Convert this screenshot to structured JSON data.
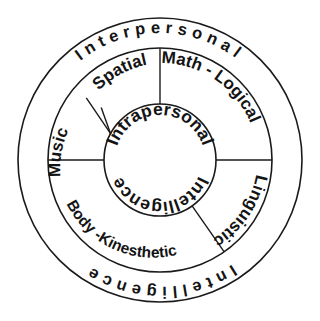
{
  "diagram": {
    "type": "concentric-circle-diagram",
    "background_color": "#ffffff",
    "line_color": "#1a1a1a",
    "text_color": "#141414",
    "geometry": {
      "center_x": 160,
      "center_y": 160,
      "outer_radius": 142,
      "middle_radius": 112,
      "inner_radius": 56
    },
    "outer_ring": {
      "name": "outer-ring",
      "top_label": "Interpersonal",
      "bottom_label": "Intelligence"
    },
    "inner_core": {
      "name": "inner-core",
      "line_one": "Intrapersonal",
      "line_two": "Intelligence"
    },
    "segments": [
      {
        "id": "spatial",
        "label": "Spatial",
        "start_angle": -62,
        "end_angle": 0
      },
      {
        "id": "math-logical",
        "label": "Math - Logical",
        "start_angle": 0,
        "end_angle": 90
      },
      {
        "id": "linguistic",
        "label": "Linguistic",
        "start_angle": 90,
        "end_angle": 145
      },
      {
        "id": "body-kinesthetic",
        "label": "Body -Kinesthetic",
        "start_angle": 145,
        "end_angle": 180
      },
      {
        "id": "music",
        "label": "Music",
        "start_angle": 180,
        "end_angle": 298
      }
    ],
    "divider_angles_deg": [
      0,
      90,
      145,
      180,
      298
    ]
  }
}
